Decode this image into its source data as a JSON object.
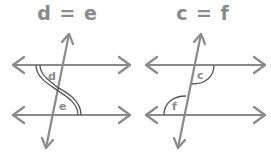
{
  "diagrams": [
    {
      "title": "d = e",
      "type": "alternate-interior-angles",
      "angles": [
        {
          "label": "d",
          "position": "below upper line, left of transversal",
          "marker": "double-arc"
        },
        {
          "label": "e",
          "position": "above lower line, right of transversal",
          "marker": "double-arc"
        }
      ]
    },
    {
      "title": "c = f",
      "type": "alternate-interior-angles",
      "angles": [
        {
          "label": "c",
          "position": "below upper line, right of transversal",
          "marker": "single-arc"
        },
        {
          "label": "f",
          "position": "above lower line, left of transversal",
          "marker": "single-arc"
        }
      ]
    }
  ],
  "colors": {
    "line": "#8a8a8a",
    "arc": "#555555",
    "text": "#8a8a8a",
    "background": "#ffffff"
  }
}
